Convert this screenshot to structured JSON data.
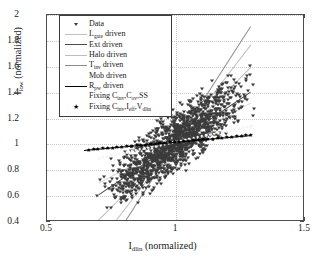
{
  "chart_data": {
    "type": "scatter",
    "title": "",
    "xlabel": "I_dlin (normalized)",
    "ylabel": "I_low (normalized)",
    "xlim": [
      0.5,
      1.5
    ],
    "ylim": [
      0.4,
      2.0
    ],
    "xticks": [
      "0.5",
      "1",
      "1.5"
    ],
    "xtick_values": [
      0.5,
      1.0,
      1.5
    ],
    "yticks": [
      "0.4",
      "0.6",
      "0.8",
      "1",
      "1.2",
      "1.4",
      "1.6",
      "1.8",
      "2"
    ],
    "ytick_values": [
      0.4,
      0.6,
      0.8,
      1.0,
      1.2,
      1.4,
      1.6,
      1.8,
      2.0
    ],
    "grid": true,
    "grid_style": "dotted",
    "legend_position": "upper-left",
    "pivot": [
      1.0,
      1.02
    ],
    "series": [
      {
        "name": "Data",
        "marker": "triangle-down",
        "color": "#3b3b3b",
        "description": "Monte-Carlo scatter cloud of normalized low-current vs normalized linear drain current, correlated positive slope",
        "n_points": 1500,
        "x_range": [
          0.6,
          1.45
        ],
        "y_range": [
          0.58,
          1.62
        ]
      },
      {
        "name": "L_gate driven",
        "type": "line",
        "color": "#c0c0c0",
        "slope": 2.6
      },
      {
        "name": "Ext driven",
        "type": "line",
        "color": "#4a4a4a",
        "slope": 1.35
      },
      {
        "name": "Halo driven",
        "type": "line",
        "color": "#bdbdbd",
        "slope": 2.0
      },
      {
        "name": "T_inv driven",
        "type": "line",
        "color": "#8c8c8c",
        "slope": 3.1
      },
      {
        "name": "Mob driven",
        "type": "line",
        "color": "#d8d8d8",
        "slope": 1.05
      },
      {
        "name": "R_pw driven",
        "type": "line",
        "color": "#000000",
        "slope": 0.18
      },
      {
        "name": "Fixing C_inv,C_ov,SS",
        "type": "line",
        "color": "#f2f2f2",
        "slope": 0.42
      },
      {
        "name": "Fixing C_inv,I_eff,V_dlin",
        "type": "marker",
        "marker": "star",
        "color": "#000000"
      }
    ]
  },
  "axes": {
    "xlabel_main": "I",
    "xlabel_sub": "dlin",
    "xlabel_tail": " (normalized)",
    "ylabel_main": "I",
    "ylabel_sub": "low",
    "ylabel_tail": " (normalized)"
  },
  "legend": {
    "entries": [
      {
        "key": "triangle",
        "text": "Data",
        "sub": "",
        "tail": "",
        "color": "#3b3b3b"
      },
      {
        "key": "line",
        "text": "L",
        "sub": "gate",
        "tail": " driven",
        "color": "#c0c0c0"
      },
      {
        "key": "line",
        "text": "Ext driven",
        "sub": "",
        "tail": "",
        "color": "#4a4a4a"
      },
      {
        "key": "line",
        "text": "Halo driven",
        "sub": "",
        "tail": "",
        "color": "#bdbdbd"
      },
      {
        "key": "line",
        "text": "T",
        "sub": "inv",
        "tail": " driven",
        "color": "#8c8c8c"
      },
      {
        "key": "line",
        "text": "Mob driven",
        "sub": "",
        "tail": "",
        "color": "#d8d8d8"
      },
      {
        "key": "line",
        "text": "R",
        "sub": "pw",
        "tail": " driven",
        "color": "#000000"
      },
      {
        "key": "line",
        "text": "Fixing C",
        "sub": "inv",
        "tail": ",C",
        "sub2": "ov",
        "tail2": ",SS",
        "color": "#f2f2f2"
      },
      {
        "key": "star",
        "text": "Fixing C",
        "sub": "inv",
        "tail": ",I",
        "sub2": "eff",
        "tail2": ",V",
        "sub3": "dlin",
        "color": "#000000"
      }
    ]
  }
}
